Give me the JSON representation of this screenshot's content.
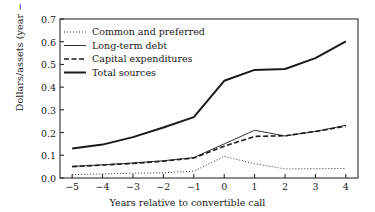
{
  "chart_data": {
    "type": "line",
    "title": "",
    "xlabel": "Years relative to convertible call",
    "ylabel": "Dollars/assets (year − 1)",
    "x": [
      -5,
      -4,
      -3,
      -2,
      -1,
      0,
      1,
      2,
      3,
      4
    ],
    "xtick_labels": [
      "−5",
      "−4",
      "−3",
      "−2",
      "−1",
      "0",
      "1",
      "2",
      "3",
      "4"
    ],
    "ytick_labels": [
      "0.0",
      "0.1",
      "0.2",
      "0.3",
      "0.4",
      "0.5",
      "0.6",
      "0.7"
    ],
    "ytick_values": [
      0.0,
      0.1,
      0.2,
      0.3,
      0.4,
      0.5,
      0.6,
      0.7
    ],
    "xlim": [
      -5.4,
      4.4
    ],
    "ylim": [
      0.0,
      0.7
    ],
    "grid": false,
    "legend_position": "upper-left",
    "series": [
      {
        "name": "Common and preferred",
        "style": "dotted",
        "width": 1.0,
        "color": "#333333",
        "values": [
          0.015,
          0.018,
          0.021,
          0.023,
          0.03,
          0.095,
          0.063,
          0.04,
          0.041,
          0.042
        ]
      },
      {
        "name": "Long-term debt",
        "style": "solid",
        "width": 1.0,
        "color": "#333333",
        "values": [
          0.051,
          0.058,
          0.066,
          0.076,
          0.09,
          0.15,
          0.21,
          0.185,
          0.205,
          0.232
        ]
      },
      {
        "name": "Capital expenditures",
        "style": "dashed",
        "width": 1.6,
        "color": "#1a1a1a",
        "values": [
          0.05,
          0.057,
          0.064,
          0.074,
          0.088,
          0.14,
          0.183,
          0.186,
          0.205,
          0.228
        ]
      },
      {
        "name": "Total sources",
        "style": "solid",
        "width": 2.0,
        "color": "#1a1a1a",
        "values": [
          0.13,
          0.147,
          0.18,
          0.222,
          0.268,
          0.428,
          0.476,
          0.48,
          0.528,
          0.602
        ]
      }
    ]
  },
  "axis": {
    "ylabel": "Dollars/assets (year − 1)",
    "xlabel": "Years relative to convertible call"
  }
}
